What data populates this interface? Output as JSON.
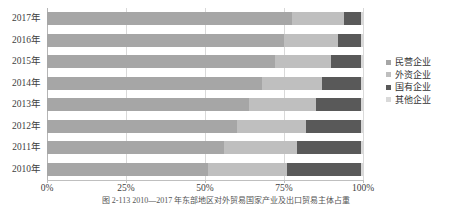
{
  "chart_data": {
    "type": "bar",
    "orientation": "horizontal",
    "stacked": true,
    "normalized": true,
    "title": "",
    "xlabel": "",
    "ylabel": "",
    "xlim": [
      0,
      100
    ],
    "grid": true,
    "legend_position": "right",
    "categories": [
      "2017年",
      "2016年",
      "2015年",
      "2014年",
      "2013年",
      "2012年",
      "2011年",
      "2010年"
    ],
    "xtick_labels": [
      "0%",
      "25%",
      "50%",
      "75%",
      "100%"
    ],
    "xtick_values": [
      0,
      25,
      50,
      75,
      100
    ],
    "series": [
      {
        "name": "民营企业",
        "color": "#a6a6a6",
        "values": [
          77.5,
          75.0,
          72.0,
          68.0,
          64.0,
          60.0,
          56.0,
          51.0
        ]
      },
      {
        "name": "外资企业",
        "color": "#bfbfbf",
        "values": [
          16.5,
          17.0,
          18.0,
          19.0,
          21.0,
          22.0,
          23.0,
          25.0
        ]
      },
      {
        "name": "国有企业",
        "color": "#595959",
        "values": [
          5.5,
          7.5,
          9.5,
          12.5,
          14.5,
          17.5,
          20.5,
          23.5
        ]
      },
      {
        "name": "其他企业",
        "color": "#d9d9d9",
        "values": [
          0.5,
          0.5,
          0.5,
          0.5,
          0.5,
          0.5,
          0.5,
          0.5
        ]
      }
    ]
  },
  "legend": {
    "items": [
      {
        "label": "民营企业",
        "color": "#a6a6a6"
      },
      {
        "label": "外资企业",
        "color": "#bfbfbf"
      },
      {
        "label": "国有企业",
        "color": "#595959"
      },
      {
        "label": "其他企业",
        "color": "#d9d9d9"
      }
    ]
  },
  "caption": {
    "text": "图 2-113  2010—2017 年东部地区对外贸易国家产业及出口贸易主体占重"
  }
}
